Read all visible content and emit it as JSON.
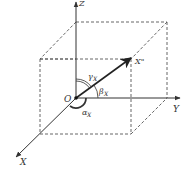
{
  "diagram": {
    "type": "3d-coordinate-direction-angles",
    "axes": {
      "z_label": "Z",
      "y_label": "Y",
      "x_label": "X"
    },
    "origin_label": "O",
    "vector_label": "X\"",
    "angles": {
      "alpha": {
        "symbol": "α",
        "subscript": "X"
      },
      "beta": {
        "symbol": "β",
        "subscript": "X"
      },
      "gamma": {
        "symbol": "γ",
        "subscript": "X"
      }
    },
    "colors": {
      "line": "#333333",
      "dashed": "#555555",
      "background": "#ffffff"
    }
  }
}
